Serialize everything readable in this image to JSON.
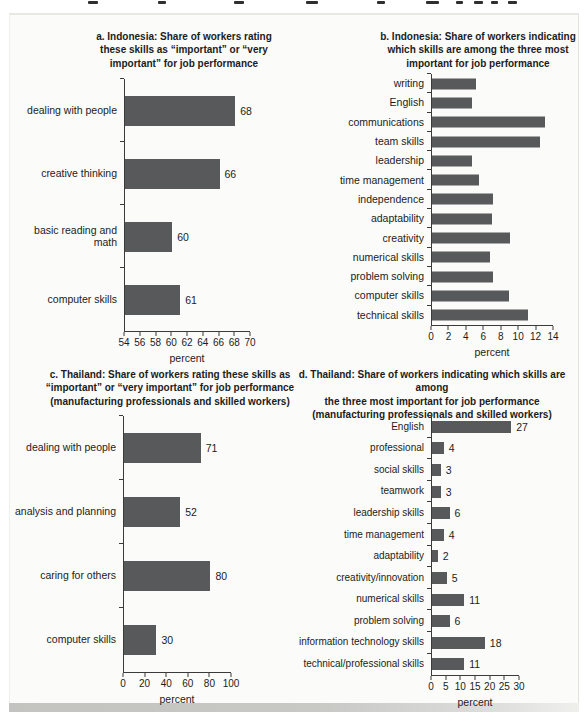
{
  "colors": {
    "bar": "#58595b",
    "text": "#1c1c1c",
    "axis": "#3a3a3a",
    "panel_background": "#fbfbf9",
    "panel_edge_bottom": "#c3c3c0",
    "page_background": "#ffffff"
  },
  "chart_data": [
    {
      "id": "a",
      "type": "bar",
      "orientation": "horizontal",
      "title": "a. Indonesia: Share of workers rating\nthese skills as “important” or “very\nimportant” for job performance",
      "categories": [
        "dealing with people",
        "creative thinking",
        "basic reading and math",
        "computer skills"
      ],
      "values": [
        68,
        66,
        60,
        61
      ],
      "value_labels": [
        "68",
        "66",
        "60",
        "61"
      ],
      "show_values": true,
      "xlabel": "percent",
      "xlim": [
        54,
        70
      ],
      "xticks": [
        54,
        56,
        58,
        60,
        62,
        64,
        66,
        68,
        70
      ],
      "layout": {
        "label_px": 112,
        "label_font_px": 10.5,
        "track_px": 126,
        "row_px": 63,
        "bar_px": 30,
        "plot_top_px": 54,
        "pad_left_px": 2
      }
    },
    {
      "id": "b",
      "type": "bar",
      "orientation": "horizontal",
      "title": "b. Indonesia: Share of workers indicating\nwhich skills are among the three most\nimportant for job performance",
      "categories": [
        "writing",
        "English",
        "communications",
        "team skills",
        "leadership",
        "time management",
        "independence",
        "adaptability",
        "creativity",
        "numerical skills",
        "problem solving",
        "computer skills",
        "technical skills"
      ],
      "values": [
        5,
        4.6,
        13,
        12.4,
        4.6,
        5.4,
        7,
        6.9,
        9,
        6.7,
        7,
        8.8,
        11
      ],
      "value_labels": [],
      "show_values": false,
      "xlabel": "percent",
      "xlim": [
        0,
        14
      ],
      "xticks": [
        0,
        2,
        4,
        6,
        8,
        10,
        12,
        14
      ],
      "layout": {
        "label_px": 139,
        "label_font_px": 10.5,
        "track_px": 122,
        "row_px": 19.3,
        "bar_px": 11,
        "plot_top_px": 49,
        "pad_left_px": 2
      }
    },
    {
      "id": "c",
      "type": "bar",
      "orientation": "horizontal",
      "title": "c. Thailand: Share of workers rating these skills as\n“important” or “very important” for job performance\n(manufacturing professionals and skilled workers)",
      "categories": [
        "dealing with people",
        "analysis and planning",
        "caring for others",
        "computer skills"
      ],
      "values": [
        71,
        52,
        80,
        30
      ],
      "value_labels": [
        "71",
        "52",
        "80",
        "30"
      ],
      "show_values": true,
      "xlabel": "percent",
      "xlim": [
        0,
        100
      ],
      "xticks": [
        0,
        20,
        40,
        60,
        80,
        100
      ],
      "layout": {
        "label_px": 110,
        "label_font_px": 10.5,
        "track_px": 108,
        "row_px": 64,
        "bar_px": 30,
        "plot_top_px": 54,
        "pad_left_px": 3
      }
    },
    {
      "id": "d",
      "type": "bar",
      "orientation": "horizontal",
      "title": "d. Thailand: Share of workers indicating which skills are among\nthe three most important for job performance\n(manufacturing professionals and skilled workers)",
      "categories": [
        "English",
        "professional",
        "social skills",
        "teamwork",
        "leadership skills",
        "time management",
        "adaptability",
        "creativity/innovation",
        "numerical skills",
        "problem solving",
        "information technology skills",
        "technical/professional skills"
      ],
      "values": [
        27,
        4,
        3,
        3,
        6,
        4,
        2,
        5,
        11,
        6,
        18,
        11
      ],
      "value_labels": [
        "27",
        "4",
        "3",
        "3",
        "6",
        "4",
        "2",
        "5",
        "11",
        "6",
        "18",
        "11"
      ],
      "show_values": true,
      "xlabel": "percent",
      "xlim": [
        0,
        30
      ],
      "xticks": [
        0,
        5,
        10,
        15,
        20,
        25,
        30
      ],
      "layout": {
        "label_px": 139,
        "label_font_px": 10,
        "track_px": 88,
        "row_px": 21.6,
        "bar_px": 12,
        "plot_top_px": 54,
        "pad_left_px": 2
      }
    }
  ]
}
